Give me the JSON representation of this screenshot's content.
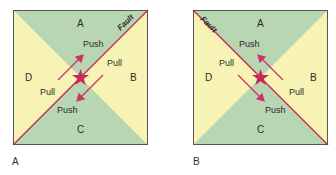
{
  "colors": {
    "green": "#b9d6b3",
    "yellow": "#f6f3b4",
    "fault_line": "#c0264f",
    "arrow": "#cc3366",
    "star": "#c8285a",
    "border": "#555555"
  },
  "panels": [
    {
      "caption": "A",
      "fault_label": "Fault",
      "quadrants": {
        "top": "A",
        "right": "B",
        "bottom": "C",
        "left": "D"
      },
      "labels": {
        "push_top": "Push",
        "pull_right": "Pull",
        "pull_left": "Pull",
        "push_bottom": "Push"
      }
    },
    {
      "caption": "B",
      "fault_label": "Fault",
      "quadrants": {
        "top": "A",
        "right": "B",
        "bottom": "C",
        "left": "D"
      },
      "labels": {
        "push_top": "Push",
        "pull_left": "Pull",
        "pull_right": "Pull",
        "push_bottom": "Push"
      }
    }
  ]
}
